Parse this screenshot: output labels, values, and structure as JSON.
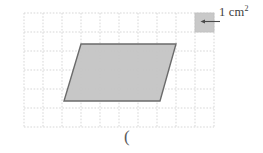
{
  "figure": {
    "grid": {
      "left": 24,
      "top": 13,
      "cell_size": 19,
      "cols": 10,
      "rows": 6,
      "line_color": "#cfcfcf",
      "line_style": "dashed"
    },
    "legend": {
      "square_label": "1 cm",
      "square_exponent": "2",
      "swatch_fill": "#c9c9c9",
      "swatch_stroke": "#b8b8b8",
      "arrow_color": "#4a4a4a",
      "swatch": {
        "x": 195,
        "y": 13,
        "size": 19
      }
    },
    "shape": {
      "name": "parallelogram",
      "fill": "#c4c4c4",
      "stroke": "#6b6b6b",
      "stroke_width": 1.4,
      "vertices": [
        {
          "x": 81,
          "y": 44
        },
        {
          "x": 176,
          "y": 44
        },
        {
          "x": 160,
          "y": 101
        },
        {
          "x": 64,
          "y": 101
        }
      ],
      "base_cells": 5,
      "height_cells": 3
    },
    "annotation": {
      "paren": "("
    }
  }
}
